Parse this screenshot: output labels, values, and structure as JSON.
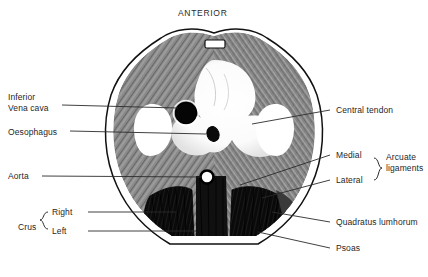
{
  "figure": {
    "title": "ANTERIOR",
    "type": "anatomical-cross-section",
    "colors": {
      "background": "#ffffff",
      "outline": "#111111",
      "muscle_hatching": "#7c7c7c",
      "tendon": "#ffffff",
      "crus_dark": "#0d0d0d",
      "leader_line": "#2b2b2b",
      "text": "#1f1f1f"
    }
  },
  "labels_left": [
    {
      "id": "inferior-vena-cava",
      "line1": "Inferior",
      "line2": "Vena cava",
      "x": 8,
      "y": 96
    },
    {
      "id": "oesophagus",
      "line1": "Oesophagus",
      "line2": "",
      "x": 8,
      "y": 128
    },
    {
      "id": "aorta",
      "line1": "Aorta",
      "line2": "",
      "x": 8,
      "y": 172
    }
  ],
  "labels_right": [
    {
      "id": "central-tendon",
      "text": "Central tendon",
      "x": 333,
      "y": 107
    },
    {
      "id": "medial",
      "text": "Medial",
      "x": 333,
      "y": 152
    },
    {
      "id": "lateral",
      "text": "Lateral",
      "x": 333,
      "y": 177
    },
    {
      "id": "quadratus-lumborum",
      "text": "Quadratus lumhorum",
      "x": 333,
      "y": 219
    },
    {
      "id": "psoas",
      "text": "Psoas",
      "x": 333,
      "y": 245
    }
  ],
  "groups": [
    {
      "id": "crus",
      "text": "Crus",
      "x": 22,
      "y": 222,
      "members": [
        "Right",
        "Left"
      ]
    },
    {
      "id": "arcuate-ligaments",
      "line1": "Arcuate",
      "line2": "ligaments",
      "x": 386,
      "y": 157,
      "members": [
        "Medial",
        "Lateral"
      ]
    }
  ],
  "group_members": [
    {
      "id": "crus-right",
      "text": "Right",
      "x": 52,
      "y": 213
    },
    {
      "id": "crus-left",
      "text": "Left",
      "x": 52,
      "y": 232
    }
  ],
  "structures": [
    {
      "id": "body-wall-outline",
      "note": "double outline, skin and muscle layers"
    },
    {
      "id": "sternum-xiphoid",
      "note": "small rectangle at anterior apex"
    },
    {
      "id": "diaphragm-muscle",
      "note": "grey radial hatching"
    },
    {
      "id": "central-tendon-region",
      "note": "white trefoil"
    },
    {
      "id": "ivc-opening",
      "note": "solid black circle"
    },
    {
      "id": "oesophageal-opening",
      "note": "small dark oval"
    },
    {
      "id": "aortic-opening",
      "note": "small ring with white lumen"
    },
    {
      "id": "right-crus",
      "note": "dense black hatching"
    },
    {
      "id": "left-crus",
      "note": "dense black hatching"
    },
    {
      "id": "vertebral-body",
      "note": "central dark column"
    }
  ]
}
